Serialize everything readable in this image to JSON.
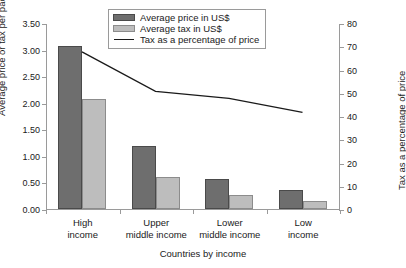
{
  "chart_data": {
    "type": "bar",
    "title": "",
    "subtitle": "",
    "xlabel": "Countries by income",
    "ylabel": "Average price or tax per pack (US$)",
    "ylabel_secondary": "Tax as a percentage of price",
    "categories": [
      "High income",
      "Upper middle income",
      "Lower middle income",
      "Low income"
    ],
    "category_lines": [
      [
        "High",
        "income"
      ],
      [
        "Upper",
        "middle income"
      ],
      [
        "Lower",
        "middle income"
      ],
      [
        "Low",
        "income"
      ]
    ],
    "series": [
      {
        "name": "Average price in US$",
        "type": "bar",
        "axis": "left",
        "color": "#6e6e6e",
        "border": "#4a4a4a",
        "values": [
          3.07,
          1.19,
          0.56,
          0.35
        ]
      },
      {
        "name": "Average tax in US$",
        "type": "bar",
        "axis": "left",
        "color": "#bdbdbd",
        "border": "#8c8c8c",
        "values": [
          2.07,
          0.61,
          0.27,
          0.15
        ]
      },
      {
        "name": "Tax as a percentage of price",
        "type": "line",
        "axis": "right",
        "color": "#1a1a1a",
        "values": [
          68,
          51,
          48,
          42
        ]
      }
    ],
    "ylim": [
      0,
      3.5
    ],
    "ylim_secondary": [
      0,
      80
    ],
    "yticks": [
      "0.00",
      "0.50",
      "1.00",
      "1.50",
      "2.00",
      "2.50",
      "3.00",
      "3.50"
    ],
    "ytick_values": [
      0,
      0.5,
      1.0,
      1.5,
      2.0,
      2.5,
      3.0,
      3.5
    ],
    "yticks_secondary": [
      "0",
      "10",
      "20",
      "30",
      "40",
      "50",
      "60",
      "70",
      "80"
    ],
    "ytick_values_secondary": [
      0,
      10,
      20,
      30,
      40,
      50,
      60,
      70,
      80
    ],
    "grid": false,
    "legend_position": "top-center",
    "legend_entries": [
      "Average price in US$",
      "Average tax in US$",
      "Tax as a percentage of price"
    ]
  }
}
